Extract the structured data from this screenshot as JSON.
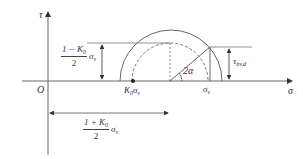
{
  "diagram": {
    "type": "mohr-circle",
    "axes": {
      "vertical_label": "τ",
      "horizontal_label": "σ",
      "origin_label": "O"
    },
    "points": {
      "k0_sigma_label": "K",
      "k0_sigma_sub": "0",
      "k0_sigma_tail": "σ",
      "k0_sigma_tail_sub": "v",
      "sigma_v_label": "σ",
      "sigma_v_sub": "v"
    },
    "angle_label": "2α",
    "tau_label": "τ",
    "tau_sub": "bv,d",
    "radius_annotation": {
      "numerator": "1 − K",
      "numerator_sub": "0",
      "denominator": "2",
      "tail": "σ",
      "tail_sub": "v"
    },
    "center_annotation": {
      "numerator": "1 + K",
      "numerator_sub": "0",
      "denominator": "2",
      "tail": "σ",
      "tail_sub": "v"
    },
    "colors": {
      "line": "#555555",
      "axis": "#666666",
      "text": "#333333",
      "background": "#ffffff"
    }
  }
}
